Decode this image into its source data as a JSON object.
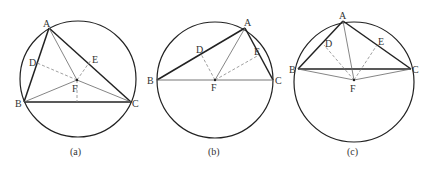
{
  "figures": [
    {
      "caption": "(a)",
      "circle": {
        "cx": 78,
        "cy": 79,
        "r": 58
      },
      "points": {
        "A": {
          "x": 49,
          "y": 28,
          "label": "A"
        },
        "B": {
          "x": 24,
          "y": 102,
          "label": "B"
        },
        "C": {
          "x": 131,
          "y": 102,
          "label": "C"
        },
        "D": {
          "x": 37,
          "y": 63,
          "label": "D"
        },
        "E": {
          "x": 91,
          "y": 60,
          "label": "E"
        },
        "F": {
          "x": 77,
          "y": 80,
          "label": "F"
        }
      }
    },
    {
      "caption": "(b)",
      "circle": {
        "cx": 215,
        "cy": 80,
        "r": 58
      },
      "points": {
        "A": {
          "x": 245,
          "y": 28,
          "label": "A"
        },
        "B": {
          "x": 157,
          "y": 80,
          "label": "B"
        },
        "C": {
          "x": 273,
          "y": 80,
          "label": "C"
        },
        "D": {
          "x": 201,
          "y": 54,
          "label": "D"
        },
        "E": {
          "x": 259,
          "y": 55,
          "label": "E"
        },
        "F": {
          "x": 215,
          "y": 80,
          "label": "F"
        }
      }
    },
    {
      "caption": "(c)",
      "circle": {
        "cx": 354,
        "cy": 82,
        "r": 60
      },
      "points": {
        "A": {
          "x": 343,
          "y": 21,
          "label": "A"
        },
        "B": {
          "x": 298,
          "y": 69,
          "label": "B"
        },
        "C": {
          "x": 411,
          "y": 69,
          "label": "C"
        },
        "D": {
          "x": 324,
          "y": 45,
          "label": "D"
        },
        "E": {
          "x": 377,
          "y": 45,
          "label": "E"
        },
        "F": {
          "x": 354,
          "y": 80,
          "label": "F"
        }
      }
    }
  ],
  "colors": {
    "thick_line": "#222222",
    "thin_line": "#666666",
    "dashed_line": "#888888"
  }
}
